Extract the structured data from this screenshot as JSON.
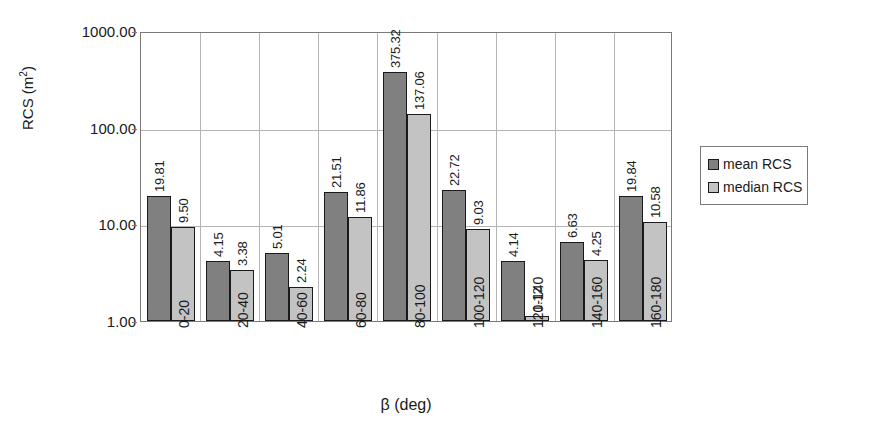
{
  "chart_data": {
    "type": "bar",
    "title": "",
    "xlabel": "β (deg)",
    "ylabel": "RCS (m²)",
    "ylabel_base": "RCS (m",
    "ylabel_sup": "2",
    "ylabel_close": ")",
    "yscale": "log",
    "ylim": [
      1.0,
      1000.0
    ],
    "ytick_labels": [
      "1000.00",
      "100.00",
      "10.00",
      "1.00"
    ],
    "ytick_values": [
      1000,
      100,
      10,
      1
    ],
    "grid": true,
    "legend_position": "right",
    "categories": [
      "0-20",
      "20-40",
      "40-60",
      "60-80",
      "80-100",
      "100-120",
      "120-140",
      "140-160",
      "160-180"
    ],
    "series": [
      {
        "name": "mean RCS",
        "color": "#808080",
        "values": [
          19.81,
          4.15,
          5.01,
          21.51,
          375.32,
          22.72,
          4.14,
          6.63,
          19.84
        ],
        "labels": [
          "19.81",
          "4.15",
          "5.01",
          "21.51",
          "375.32",
          "22.72",
          "4.14",
          "6.63",
          "19.84"
        ]
      },
      {
        "name": "median RCS",
        "color": "#c3c3c3",
        "values": [
          9.5,
          3.38,
          2.24,
          11.86,
          137.06,
          9.03,
          1.12,
          4.25,
          10.58
        ],
        "labels": [
          "9.50",
          "3.38",
          "2.24",
          "11.86",
          "137.06",
          "9.03",
          "1.12",
          "4.25",
          "10.58"
        ]
      }
    ]
  },
  "legend": {
    "entries": [
      {
        "label": "mean RCS",
        "color": "#808080"
      },
      {
        "label": "median RCS",
        "color": "#c3c3c3"
      }
    ]
  }
}
